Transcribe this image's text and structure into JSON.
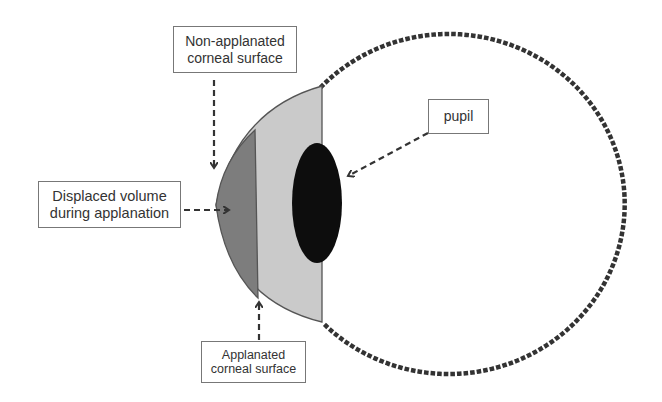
{
  "diagram": {
    "title": "",
    "colors": {
      "background": "#ffffff",
      "displaced_volume": "#7d7d7d",
      "cornea_region": "#cacaca",
      "pupil": "#0d0d0d",
      "outline": "#555555",
      "dotted_eyeball": "#333333",
      "arrows": "#333333"
    },
    "labels": {
      "non_applanated": {
        "line1": "Non-applanated",
        "line2": "corneal surface"
      },
      "displaced_volume": {
        "line1": "Displaced volume",
        "line2": "during applanation"
      },
      "applanated": {
        "line1": "Applanated",
        "line2": "corneal surface"
      },
      "pupil": {
        "line1": "pupil"
      }
    },
    "shapes": [
      "dotted-circle-eyeball",
      "light-gray-corneal-cap",
      "dark-gray-displaced-volume",
      "black-pupil-ellipse"
    ],
    "arrows": [
      {
        "from": "non_applanated",
        "to": "non-applanated-corneal-surface",
        "direction": "down"
      },
      {
        "from": "displaced_volume",
        "to": "displaced-volume-region",
        "direction": "right"
      },
      {
        "from": "applanated",
        "to": "applanated-corneal-surface",
        "direction": "up"
      },
      {
        "from": "pupil",
        "to": "pupil-ellipse",
        "direction": "down-left"
      }
    ]
  }
}
